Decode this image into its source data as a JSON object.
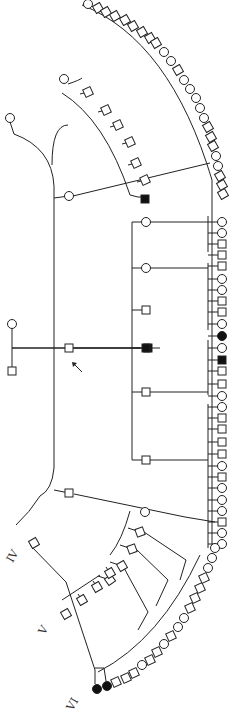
{
  "diagram": {
    "type": "pedigree",
    "generation_labels": [
      "IV",
      "V",
      "VI"
    ],
    "proband_marker": "arrow",
    "legend": {
      "open_square": "unaffected male",
      "open_circle": "unaffected female",
      "filled_square": "affected male",
      "filled_circle": "affected female"
    },
    "founders": [
      {
        "id": "F1",
        "sex": "female",
        "affected": false
      },
      {
        "id": "F2",
        "sex": "male",
        "affected": false
      },
      {
        "id": "P",
        "sex": "male",
        "affected": false,
        "proband": true
      },
      {
        "id": "S1",
        "sex": "female",
        "affected": false
      }
    ],
    "right_column": [
      "F",
      "F",
      "M",
      "M",
      "M",
      "F",
      "F",
      "M",
      "M",
      "F",
      "A",
      "F",
      "AM",
      "M",
      "M",
      "F",
      "F",
      "M",
      "M",
      "M",
      "M",
      "F",
      "M",
      "F",
      "F",
      "F",
      "M",
      "F",
      "F",
      "M",
      "M",
      "M"
    ],
    "bottom_affected": [
      {
        "sex": "female",
        "affected": true
      },
      {
        "sex": "female",
        "affected": true
      }
    ],
    "inner_sibship": [
      {
        "sex": "female",
        "affected": false
      },
      {
        "sex": "female",
        "affected": false
      },
      {
        "sex": "male",
        "affected": false
      },
      {
        "sex": "male",
        "affected": true
      },
      {
        "sex": "male",
        "affected": false
      },
      {
        "sex": "male",
        "affected": false
      }
    ]
  }
}
